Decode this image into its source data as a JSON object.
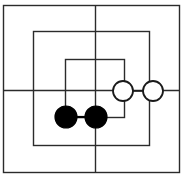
{
  "figure": {
    "canvas": {
      "width": 183,
      "height": 176,
      "background": "#ffffff"
    },
    "stroke": {
      "color": "#2b2b2b",
      "width": 1.4
    },
    "rectangles": [
      {
        "name": "outer-rectangle",
        "x": 3,
        "y": 5,
        "width": 176,
        "height": 167
      },
      {
        "name": "middle-rectangle",
        "x": 33,
        "y": 31,
        "width": 116,
        "height": 114
      },
      {
        "name": "inner-rectangle",
        "x": 65,
        "y": 59,
        "width": 59,
        "height": 58
      }
    ],
    "lines": [
      {
        "name": "vertical-crossing-line",
        "x1": 95,
        "y1": 5,
        "x2": 95,
        "y2": 172
      },
      {
        "name": "horizontal-crossing-line",
        "x1": 3,
        "y1": 90,
        "x2": 179,
        "y2": 90
      }
    ],
    "nodes": [
      {
        "name": "filled-node-left",
        "type": "filled",
        "cx": 66,
        "cy": 117,
        "r": 11,
        "fill": "#000000",
        "stroke": "#000000"
      },
      {
        "name": "filled-node-right",
        "type": "filled",
        "cx": 96,
        "cy": 117,
        "r": 11,
        "fill": "#000000",
        "stroke": "#000000"
      },
      {
        "name": "hollow-node-left",
        "type": "hollow",
        "cx": 123,
        "cy": 91,
        "r": 10,
        "fill": "#ffffff",
        "stroke": "#1a1a1a"
      },
      {
        "name": "hollow-node-right",
        "type": "hollow",
        "cx": 153,
        "cy": 91,
        "r": 10,
        "fill": "#ffffff",
        "stroke": "#1a1a1a"
      }
    ],
    "connectors": [
      {
        "name": "connector-filled-pair",
        "x1": 66,
        "y1": 117,
        "x2": 96,
        "y2": 117
      },
      {
        "name": "connector-hollow-pair",
        "x1": 123,
        "y1": 91,
        "x2": 153,
        "y2": 91
      }
    ]
  }
}
